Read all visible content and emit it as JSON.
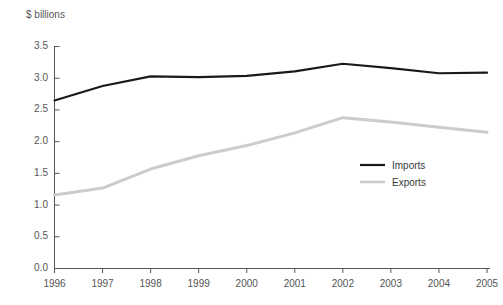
{
  "chart_data": {
    "type": "line",
    "title": "",
    "subtitle": "",
    "xlabel": "",
    "ylabel": "$ billions",
    "unit_label": "$ billions",
    "x": [
      "1996",
      "1997",
      "1998",
      "1999",
      "2000",
      "2001",
      "2002",
      "2003",
      "2004",
      "2005"
    ],
    "categories": [
      "1996",
      "1997",
      "1998",
      "1999",
      "2000",
      "2001",
      "2002",
      "2003",
      "2004",
      "2005"
    ],
    "series": [
      {
        "name": "Imports",
        "color": "#1a1a1a",
        "values": [
          2.64,
          2.87,
          3.02,
          3.01,
          3.03,
          3.1,
          3.22,
          3.15,
          3.07,
          3.08
        ]
      },
      {
        "name": "Exports",
        "color": "#cccccc",
        "values": [
          1.15,
          1.26,
          1.56,
          1.77,
          1.93,
          2.13,
          2.37,
          2.3,
          2.22,
          2.14
        ]
      }
    ],
    "xlim": [
      1996,
      2005
    ],
    "ylim": [
      0.0,
      3.5
    ],
    "yticks": [
      "0.0",
      "0.5",
      "1.0",
      "1.5",
      "2.0",
      "2.5",
      "3.0",
      "3.5"
    ],
    "ytick_values": [
      0.0,
      0.5,
      1.0,
      1.5,
      2.0,
      2.5,
      3.0,
      3.5
    ],
    "grid": false,
    "legend_position": "center-right",
    "legend_entries": [
      "Imports",
      "Exports"
    ]
  },
  "legend": {
    "items": [
      {
        "label": "Imports"
      },
      {
        "label": "Exports"
      }
    ]
  },
  "colors": {
    "imports_line": "#1a1a1a",
    "exports_line": "#cccccc",
    "axis": "#555555",
    "text": "#555555",
    "background": "#ffffff"
  }
}
